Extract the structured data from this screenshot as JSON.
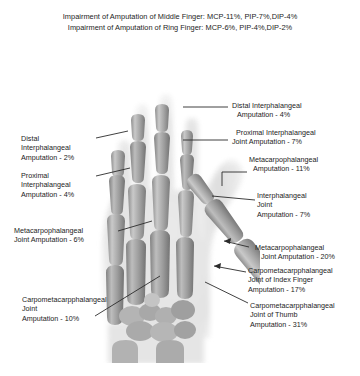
{
  "header": {
    "line1": "Impairment of Amputation of Middle Finger: MCP-11%, PIP-7%,DIP-4%",
    "line2": "Impairment of Amputation of Ring Finger: MCP-6%, PIP-4%,DIP-2%"
  },
  "image": {
    "name": "hand-radiograph",
    "description": "Anteroposterior X-ray of a right hand showing phalanges, metacarpals and carpal bones"
  },
  "annotations": {
    "right": [
      {
        "name": "distal-interphalangeal-amputation",
        "lines": [
          "Distal Interphalangeal",
          "Amputation - 4%"
        ],
        "value": "4%"
      },
      {
        "name": "proximal-interphalangeal-joint-amputation",
        "lines": [
          "Proximal Interphalangeal",
          "Joint Amputation - 7%"
        ],
        "value": "7%"
      },
      {
        "name": "metacarpophalangeal-amputation",
        "lines": [
          "Metacarpophalangeal",
          "Amputation - 11%"
        ],
        "value": "11%"
      },
      {
        "name": "interphalangeal-joint-amputation",
        "lines": [
          "Interphalangeal",
          "Joint",
          "Amputation - 7%"
        ],
        "value": "7%"
      },
      {
        "name": "metacarpophalangeal-joint-amputation",
        "lines": [
          "Metacarpophalangeal",
          "Joint Amputation - 20%"
        ],
        "value": "20%"
      },
      {
        "name": "carpometacarpphalangeal-joint-index-finger-amputation",
        "lines": [
          "Carpometacarpphalangeal",
          "Joint of Index Finger",
          "Amputation - 17%"
        ],
        "value": "17%"
      },
      {
        "name": "carpometacarpphalangeal-joint-thumb-amputation",
        "lines": [
          "Carpometacarpphalangeal",
          "Joint of Thumb",
          "Amputation - 31%"
        ],
        "value": "31%"
      }
    ],
    "left": [
      {
        "name": "distal-interphalangeal-amputation-ring",
        "lines": [
          "Distal",
          "Interphalangeal",
          "Amputation - 2%"
        ],
        "value": "2%"
      },
      {
        "name": "proximal-interphalangeal-amputation-ring",
        "lines": [
          "Proximal",
          "Interphalangeal",
          "Amputation - 4%"
        ],
        "value": "4%"
      },
      {
        "name": "metacarpophalangeal-joint-amputation-ring",
        "lines": [
          "Metacarpophalangeal",
          "Joint Amputation - 6%"
        ],
        "value": "6%"
      },
      {
        "name": "carpometacarpphalangeal-joint-amputation",
        "lines": [
          "Carpometacarpphalangeal",
          "Joint",
          "Amputation - 10%"
        ],
        "value": "10%"
      }
    ]
  },
  "colors": {
    "text": "#1c1c1c",
    "leader": "#2b2b2b",
    "background": "#ffffff",
    "bone_light": "#d8d8d8",
    "bone_mid": "#9a9a9a",
    "bone_dark": "#6e6e6e",
    "soft_tissue": "#e6e6e6"
  }
}
